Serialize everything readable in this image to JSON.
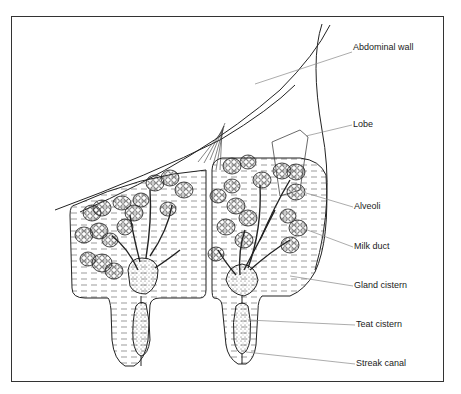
{
  "diagram": {
    "labels": [
      {
        "id": "abdominal-wall",
        "text": "Abdominal wall",
        "x": 353,
        "y": 48
      },
      {
        "id": "lobe",
        "text": "Lobe",
        "x": 353,
        "y": 120
      },
      {
        "id": "alveoli",
        "text": "Alveoli",
        "x": 354,
        "y": 203
      },
      {
        "id": "milk-duct",
        "text": "Milk duct",
        "x": 354,
        "y": 243
      },
      {
        "id": "gland-cistern",
        "text": "Gland cistern",
        "x": 354,
        "y": 282
      },
      {
        "id": "teat-cistern",
        "text": "Teat cistern",
        "x": 356,
        "y": 321
      },
      {
        "id": "streak-canal",
        "text": "Streak canal",
        "x": 356,
        "y": 360
      }
    ]
  }
}
